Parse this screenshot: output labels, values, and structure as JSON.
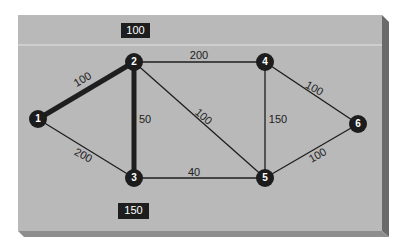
{
  "diagram": {
    "type": "weighted-graph",
    "colors": {
      "panel": "#b9b9b9",
      "panel_highlight": "#e4e4e4",
      "panel_side": "#6a6a6a",
      "panel_bottom": "#8e8e8e",
      "node_fill": "#1c1c1c",
      "node_text": "#ffffff",
      "edge": "#1e1e1e",
      "label_text": "#222222",
      "badge_fill": "#1e1e1e",
      "badge_text": "#ffffff"
    },
    "badges": [
      {
        "id": "top-badge",
        "label": "100",
        "x": 121,
        "y": 23,
        "w": 29,
        "h": 15
      },
      {
        "id": "bottom-badge",
        "label": "150",
        "x": 118,
        "y": 203,
        "w": 31,
        "h": 16
      }
    ],
    "nodes": [
      {
        "id": "1",
        "label": "1",
        "x": 38,
        "y": 119
      },
      {
        "id": "2",
        "label": "2",
        "x": 134,
        "y": 62
      },
      {
        "id": "3",
        "label": "3",
        "x": 134,
        "y": 178
      },
      {
        "id": "4",
        "label": "4",
        "x": 265,
        "y": 62
      },
      {
        "id": "5",
        "label": "5",
        "x": 265,
        "y": 178
      },
      {
        "id": "6",
        "label": "6",
        "x": 358,
        "y": 124
      }
    ],
    "edges": [
      {
        "from": "1",
        "to": "2",
        "weight": "100",
        "bold": true,
        "lx": 83,
        "ly": 80,
        "rot": -31
      },
      {
        "from": "1",
        "to": "3",
        "weight": "200",
        "bold": false,
        "lx": 83,
        "ly": 156,
        "rot": 28
      },
      {
        "from": "2",
        "to": "3",
        "weight": "50",
        "bold": true,
        "lx": 145,
        "ly": 120,
        "rot": 0
      },
      {
        "from": "2",
        "to": "4",
        "weight": "200",
        "bold": false,
        "lx": 199,
        "ly": 56,
        "rot": 0
      },
      {
        "from": "2",
        "to": "5",
        "weight": "100",
        "bold": false,
        "lx": 203,
        "ly": 117,
        "rot": 41
      },
      {
        "from": "3",
        "to": "5",
        "weight": "40",
        "bold": false,
        "lx": 194,
        "ly": 173,
        "rot": 0
      },
      {
        "from": "4",
        "to": "5",
        "weight": "150",
        "bold": false,
        "lx": 278,
        "ly": 120,
        "rot": 0
      },
      {
        "from": "4",
        "to": "6",
        "weight": "100",
        "bold": false,
        "lx": 314,
        "ly": 89,
        "rot": 30
      },
      {
        "from": "5",
        "to": "6",
        "weight": "100",
        "bold": false,
        "lx": 318,
        "ly": 156,
        "rot": -30
      }
    ]
  }
}
